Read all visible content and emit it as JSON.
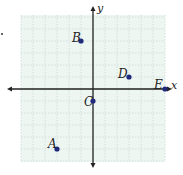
{
  "diagram": {
    "type": "coordinate-plane",
    "axes": {
      "x_label": "x",
      "y_label": "y"
    },
    "grid": {
      "units_per_side": 6,
      "unit_px": 12,
      "origin_px": [
        93,
        89
      ]
    },
    "points": [
      {
        "label": "A",
        "x": -3,
        "y": -5
      },
      {
        "label": "B",
        "x": -1,
        "y": 4
      },
      {
        "label": "C",
        "x": 0,
        "y": -1
      },
      {
        "label": "D",
        "x": 3,
        "y": 1
      },
      {
        "label": "E",
        "x": 6,
        "y": 0
      }
    ],
    "colors": {
      "grid_bg": "#eef6f2",
      "grid_line": "#c9dcd6",
      "axis": "#222222",
      "point": "#1f2a7a"
    }
  }
}
